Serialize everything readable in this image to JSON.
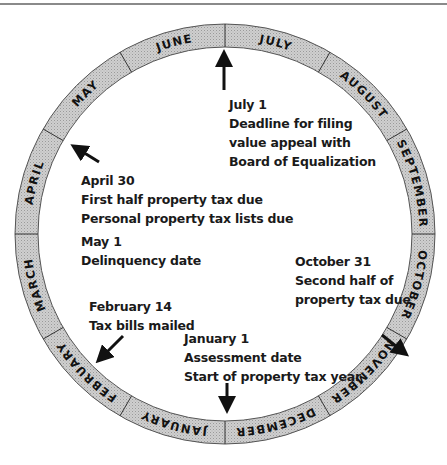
{
  "diagram": {
    "type": "circular-calendar",
    "months": [
      "JULY",
      "AUGUST",
      "SEPTEMBER",
      "OCTOBER",
      "NOVEMBER",
      "DECEMBER",
      "JANUARY",
      "FEBRUARY",
      "MARCH",
      "APRIL",
      "MAY",
      "JUNE"
    ],
    "ring_color": "#c8c8c8",
    "divider_color": "#333333"
  },
  "events": {
    "july": {
      "date": "July 1",
      "lines": [
        "Deadline for filing",
        "value appeal with",
        "Board of Equalization"
      ]
    },
    "april": {
      "date": "April 30",
      "lines": [
        "First half property tax due",
        "Personal property tax lists due"
      ]
    },
    "may": {
      "date": "May 1",
      "lines": [
        "Delinquency date"
      ]
    },
    "october": {
      "date": "October 31",
      "lines": [
        "Second half of",
        "property tax due"
      ]
    },
    "february": {
      "date": "February 14",
      "lines": [
        "Tax bills mailed"
      ]
    },
    "january": {
      "date": "January 1",
      "lines": [
        "Assessment date",
        "Start of property tax year"
      ]
    }
  }
}
